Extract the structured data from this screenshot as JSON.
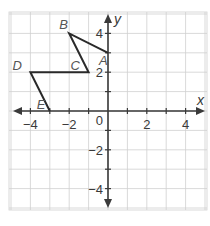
{
  "diagram": {
    "type": "coordinate-plane",
    "x_range": [
      -5,
      5
    ],
    "y_range": [
      -5,
      5
    ],
    "grid_step": 1,
    "x_axis_label": "x",
    "y_axis_label": "y",
    "origin_label": "0",
    "x_tick_labels": [
      {
        "value": -4,
        "label": "−4"
      },
      {
        "value": -2,
        "label": "−2"
      },
      {
        "value": 2,
        "label": "2"
      },
      {
        "value": 4,
        "label": "4"
      }
    ],
    "y_tick_labels": [
      {
        "value": 4,
        "label": "4"
      },
      {
        "value": 2,
        "label": "2"
      },
      {
        "value": -2,
        "label": "−2"
      },
      {
        "value": -4,
        "label": "−4"
      }
    ],
    "vertices": [
      {
        "name": "A",
        "x": 0,
        "y": 3
      },
      {
        "name": "B",
        "x": -2,
        "y": 4
      },
      {
        "name": "C",
        "x": -1,
        "y": 2
      },
      {
        "name": "D",
        "x": -4,
        "y": 2
      },
      {
        "name": "E",
        "x": -3,
        "y": 0
      }
    ],
    "path_order": [
      "A",
      "B",
      "C",
      "D",
      "E"
    ],
    "colors": {
      "grid": "#cfcfcf",
      "axis": "#3a3a3a",
      "figure": "#2a2a2a"
    }
  }
}
